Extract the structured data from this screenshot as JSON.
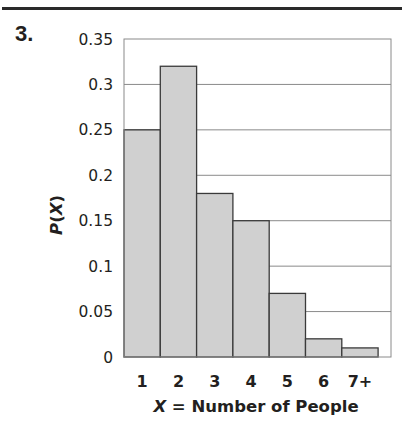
{
  "problem": {
    "number": "3."
  },
  "colors": {
    "bar_fill": "#d0d0d0",
    "bar_stroke": "#3a3a3a",
    "grid": "#8a8a8a",
    "text": "#231f20"
  },
  "chart_data": {
    "type": "bar",
    "title": "",
    "xlabel_var": "X",
    "xlabel_rest": " = Number of People",
    "xlabel": "X = Number of People",
    "ylabel": "P(X)",
    "ylabel_parts": {
      "p": "P",
      "open": "(",
      "var": "X",
      "close": ")"
    },
    "categories": [
      "1",
      "2",
      "3",
      "4",
      "5",
      "6",
      "7+"
    ],
    "values": [
      0.25,
      0.32,
      0.18,
      0.15,
      0.07,
      0.02,
      0.01
    ],
    "ylim": [
      0,
      0.35
    ],
    "yticks": [
      "0",
      "0.05",
      "0.1",
      "0.15",
      "0.2",
      "0.25",
      "0.3",
      "0.35"
    ],
    "grid": true,
    "legend": null,
    "style": "histogram (adjacent bars, no gaps)"
  }
}
